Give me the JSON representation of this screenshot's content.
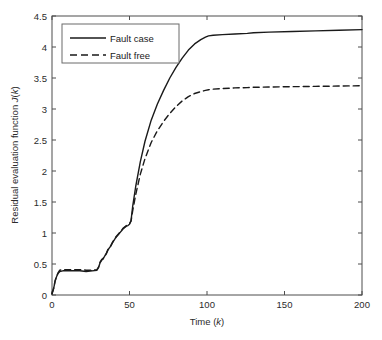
{
  "chart_data": {
    "type": "line",
    "title": "",
    "xlabel": "Time (k)",
    "ylabel": "Residual evaluation function J(k)",
    "xlim": [
      0,
      200
    ],
    "ylim": [
      0,
      4.5
    ],
    "xticks": [
      0,
      50,
      100,
      150,
      200
    ],
    "yticks": [
      0,
      0.5,
      1,
      1.5,
      2,
      2.5,
      3,
      3.5,
      4,
      4.5
    ],
    "xtick_labels": [
      "0",
      "50",
      "100",
      "150",
      "200"
    ],
    "ytick_labels": [
      "0",
      "0.5",
      "1",
      "1.5",
      "2",
      "2.5",
      "3",
      "3.5",
      "4",
      "4.5"
    ],
    "grid": false,
    "legend_position": "upper left",
    "series": [
      {
        "name": "Fault case",
        "style": "solid",
        "color": "#1a1a1a",
        "x": [
          0,
          1,
          2,
          3,
          4,
          5,
          7,
          10,
          14,
          18,
          22,
          26,
          29,
          30,
          31,
          32,
          33,
          34,
          35,
          36,
          37,
          38,
          39,
          40,
          41,
          42,
          43,
          44,
          45,
          46,
          47,
          48,
          49,
          50,
          51,
          52,
          54,
          57,
          60,
          64,
          68,
          72,
          76,
          80,
          84,
          88,
          92,
          96,
          99,
          101,
          104,
          110,
          118,
          126,
          130,
          140,
          155,
          170,
          185,
          200
        ],
        "y": [
          0.02,
          0.1,
          0.22,
          0.3,
          0.35,
          0.38,
          0.39,
          0.39,
          0.39,
          0.39,
          0.38,
          0.39,
          0.4,
          0.44,
          0.52,
          0.56,
          0.58,
          0.63,
          0.66,
          0.72,
          0.76,
          0.79,
          0.84,
          0.88,
          0.92,
          0.95,
          0.98,
          1.01,
          1.04,
          1.07,
          1.09,
          1.11,
          1.12,
          1.14,
          1.2,
          1.42,
          1.75,
          2.15,
          2.48,
          2.82,
          3.08,
          3.3,
          3.5,
          3.67,
          3.82,
          3.95,
          4.05,
          4.12,
          4.16,
          4.18,
          4.19,
          4.2,
          4.21,
          4.22,
          4.23,
          4.24,
          4.25,
          4.26,
          4.27,
          4.28
        ]
      },
      {
        "name": "Fault free",
        "style": "dashed",
        "color": "#1a1a1a",
        "x": [
          0,
          1,
          2,
          3,
          4,
          5,
          7,
          10,
          14,
          18,
          22,
          26,
          29,
          30,
          31,
          32,
          33,
          34,
          35,
          36,
          37,
          38,
          39,
          40,
          41,
          42,
          43,
          44,
          45,
          46,
          47,
          48,
          49,
          50,
          51,
          52,
          54,
          57,
          60,
          64,
          68,
          72,
          76,
          80,
          84,
          88,
          92,
          96,
          99,
          101,
          104,
          110,
          118,
          126,
          130,
          140,
          155,
          170,
          185,
          200
        ],
        "y": [
          0.02,
          0.1,
          0.23,
          0.31,
          0.36,
          0.4,
          0.41,
          0.41,
          0.41,
          0.41,
          0.4,
          0.4,
          0.41,
          0.45,
          0.53,
          0.57,
          0.59,
          0.64,
          0.67,
          0.73,
          0.77,
          0.8,
          0.85,
          0.89,
          0.93,
          0.96,
          0.99,
          1.02,
          1.05,
          1.08,
          1.1,
          1.12,
          1.13,
          1.15,
          1.19,
          1.35,
          1.62,
          1.95,
          2.2,
          2.46,
          2.65,
          2.8,
          2.93,
          3.04,
          3.13,
          3.2,
          3.25,
          3.28,
          3.3,
          3.31,
          3.32,
          3.33,
          3.34,
          3.345,
          3.35,
          3.355,
          3.36,
          3.365,
          3.37,
          3.375
        ]
      }
    ]
  },
  "axes": {
    "x_label_text": "Time (",
    "x_label_italic": "k",
    "x_label_tail": ")",
    "y_label_text": "Residual evaluation function ",
    "y_label_italic_j": "J",
    "y_label_paren_open": "(",
    "y_label_italic_k": "k",
    "y_label_paren_close": ")"
  },
  "legend": {
    "items": [
      {
        "label": "Fault case",
        "style": "solid"
      },
      {
        "label": "Fault free",
        "style": "dashed"
      }
    ]
  },
  "colors": {
    "line": "#1a1a1a",
    "axis": "#4d4d4d",
    "background": "#ffffff"
  }
}
